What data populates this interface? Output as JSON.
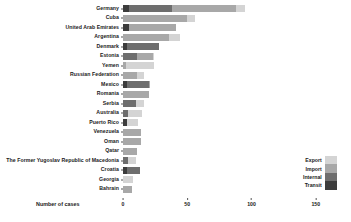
{
  "chart_data": {
    "type": "bar",
    "orientation": "horizontal",
    "stacked": true,
    "title": "",
    "subtitle": "",
    "xlabel": "Number of cases",
    "ylabel": "",
    "xlim": [
      0,
      165
    ],
    "xticks": [
      0,
      50,
      100,
      150
    ],
    "xticklabels": [
      "0",
      "50",
      "100",
      "150"
    ],
    "grid": false,
    "legend_position": "bottom-right",
    "legend": [
      "Export",
      "Import",
      "Internal",
      "Transit"
    ],
    "colors": {
      "Export": "#d4d4d4",
      "Import": "#a8a8a8",
      "Internal": "#6e6e6e",
      "Transit": "#3c3c3c"
    },
    "categories": [
      "Germany",
      "Cuba",
      "United Arab Emirates",
      "Argentina",
      "Denmark",
      "Estonia",
      "Yemen",
      "Russian Federation",
      "Mexico",
      "Romania",
      "Serbia",
      "Australia",
      "Puerto Rico",
      "Venezuela",
      "Oman",
      "Qatar",
      "The Former Yugoslav Republic of Macedonia",
      "Croatia",
      "Georgia",
      "Bahrain"
    ],
    "series": [
      {
        "name": "Export",
        "values": [
          7,
          6,
          0,
          8,
          0,
          1,
          22,
          5,
          0,
          0,
          6,
          11,
          9,
          0,
          0,
          0,
          6,
          0,
          8,
          0
        ]
      },
      {
        "name": "Import",
        "values": [
          50,
          50,
          36,
          36,
          0,
          12,
          2,
          11,
          1,
          20,
          0,
          0,
          0,
          14,
          14,
          11,
          0,
          0,
          0,
          7
        ]
      },
      {
        "name": "Internal",
        "values": [
          33,
          0,
          0,
          0,
          25,
          11,
          0,
          0,
          17,
          0,
          10,
          4,
          0,
          0,
          0,
          0,
          4,
          10,
          0,
          0
        ]
      },
      {
        "name": "Transit",
        "values": [
          5,
          0,
          5,
          0,
          3,
          0,
          0,
          0,
          3,
          0,
          0,
          0,
          3,
          0,
          0,
          0,
          0,
          3,
          0,
          0
        ]
      }
    ],
    "totals": [
      95,
      56,
      41,
      44,
      28,
      24,
      24,
      16,
      21,
      20,
      16,
      15,
      12,
      14,
      14,
      11,
      10,
      13,
      8,
      7
    ]
  }
}
